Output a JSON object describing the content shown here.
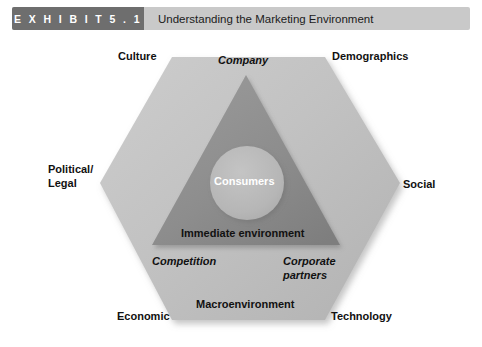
{
  "header": {
    "badge_label": "E X H I B I T   5 . 1",
    "exhibit_word": "EXHIBIT",
    "exhibit_number": "5.1",
    "title": "Understanding the Marketing Environment",
    "badge_color": "#6e6e6e",
    "bar_color": "#c9c9c9",
    "badge_text_color": "#ffffff",
    "title_text_color": "#1b1b1b"
  },
  "diagram": {
    "type": "concentric-environment-diagram",
    "shapes": {
      "hexagon": {
        "name": "macroenvironment-hexagon",
        "fill": "#c0c0c0",
        "inner_label": "Macroenvironment"
      },
      "triangle": {
        "name": "immediate-environment-triangle",
        "fill": "#8e8e8e",
        "inner_label": "Immediate environment"
      },
      "circle": {
        "name": "consumers-circle",
        "fill": "#b4b4b4",
        "inner_label": "Consumers"
      }
    },
    "macro_labels": [
      {
        "id": "culture",
        "text": "Culture"
      },
      {
        "id": "demographics",
        "text": "Demographics"
      },
      {
        "id": "political",
        "text": "Political/\nLegal"
      },
      {
        "id": "social",
        "text": "Social"
      },
      {
        "id": "economic",
        "text": "Economic"
      },
      {
        "id": "technology",
        "text": "Technology"
      }
    ],
    "immediate_labels": [
      {
        "id": "company",
        "text": "Company"
      },
      {
        "id": "competition",
        "text": "Competition"
      },
      {
        "id": "corporate-partners",
        "text": "Corporate partners"
      }
    ],
    "core_label": {
      "id": "consumers",
      "text": "Consumers"
    },
    "zone_labels": {
      "immediate": "Immediate environment",
      "macro": "Macroenvironment"
    },
    "labels": {
      "culture": "Culture",
      "demographics": "Demographics",
      "political_line1": "Political/",
      "political_line2": "Legal",
      "social": "Social",
      "economic": "Economic",
      "technology": "Technology",
      "company": "Company",
      "consumers": "Consumers",
      "immediate_environment": "Immediate environment",
      "competition": "Competition",
      "corporate_line1": "Corporate",
      "corporate_line2": "partners",
      "macroenvironment": "Macroenvironment"
    }
  }
}
